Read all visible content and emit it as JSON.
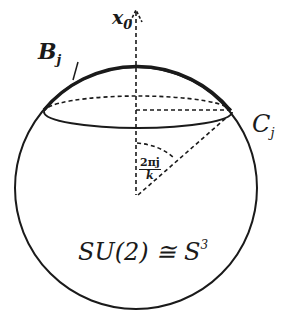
{
  "diagram": {
    "type": "geometric-sphere",
    "labels": {
      "axis": {
        "base": "x",
        "sub": "0"
      },
      "arc": {
        "base": "B",
        "sub": "j"
      },
      "circle": {
        "base": "C",
        "sub": "j"
      },
      "angle": {
        "numerator": "2πj",
        "denominator": "k"
      },
      "group": {
        "lhs": "SU(2) ≅ S",
        "sup": "3"
      }
    },
    "colors": {
      "stroke": "#1a1a1a",
      "background": "#ffffff"
    }
  }
}
